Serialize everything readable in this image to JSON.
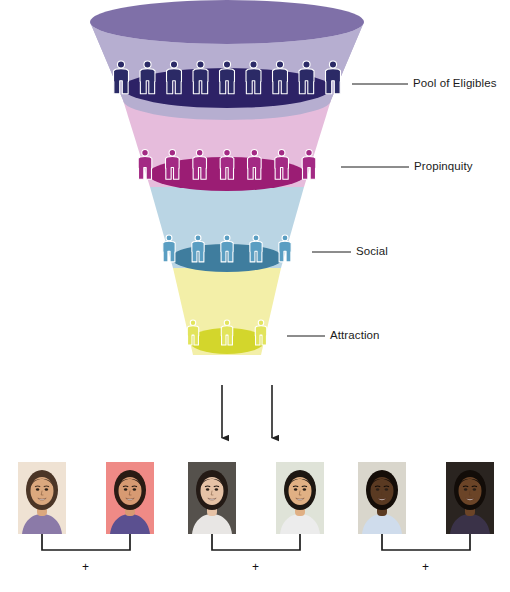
{
  "figure": {
    "background": "#ffffff"
  },
  "funnel": {
    "levels": [
      {
        "id": "pool-of-eligibles",
        "label": "Pool of Eligibles",
        "people_count": 9,
        "cone_color": "#b6aed0",
        "rim_color": "#7f70a8",
        "pool_color": "#2d2266",
        "figure_color": "#2b2a66",
        "label_x": 413,
        "label_y": 78,
        "leader_x1": 352,
        "leader_x2": 408,
        "leader_y": 84
      },
      {
        "id": "propinquity",
        "label": "Propinquity",
        "people_count": 7,
        "cone_color": "#e6bcdc",
        "rim_color": "#e6bcdc",
        "pool_color": "#9b1d74",
        "figure_color": "#a32a84",
        "label_x": 414,
        "label_y": 161,
        "leader_x1": 341,
        "leader_x2": 409,
        "leader_y": 167
      },
      {
        "id": "social",
        "label": "Social",
        "people_count": 5,
        "cone_color": "#bad5e4",
        "rim_color": "#bad5e4",
        "pool_color": "#3f7d9e",
        "figure_color": "#5a9ec2",
        "label_x": 356,
        "label_y": 246,
        "leader_x1": 312,
        "leader_x2": 351,
        "leader_y": 252
      },
      {
        "id": "attraction",
        "label": "Attraction",
        "people_count": 3,
        "cone_color": "#f3efa8",
        "rim_color": "#f3efa8",
        "pool_color": "#d3d62c",
        "figure_color": "#e2e45c",
        "label_x": 330,
        "label_y": 330,
        "leader_x1": 287,
        "leader_x2": 325,
        "leader_y": 336
      }
    ]
  },
  "arrows": {
    "count": 2,
    "color": "#222222",
    "items": [
      {
        "x": 222,
        "y_top": 385,
        "y_bottom": 445
      },
      {
        "x": 272,
        "y_top": 385,
        "y_bottom": 445
      }
    ]
  },
  "couples": [
    {
      "id": "couple-1",
      "plus": "+",
      "plus_x": 82,
      "plus_y": 561,
      "bracket": {
        "x1": 42,
        "x2": 130,
        "y_top": 534,
        "y_bottom": 550
      },
      "photos": [
        {
          "id": "person-1",
          "x": 18,
          "y": 462,
          "alt": "smiling woman with long brown hair, patterned top",
          "bg": "#efe2d3",
          "skin": "#dba87e",
          "hair": "#4b3526",
          "cloth": "#8b7aa8"
        },
        {
          "id": "person-2",
          "x": 106,
          "y": 462,
          "alt": "smiling woman with dark hair on pink background",
          "bg": "#ef8a86",
          "skin": "#d79a72",
          "hair": "#2a1b14",
          "cloth": "#5b5090"
        }
      ]
    },
    {
      "id": "couple-2",
      "plus": "+",
      "plus_x": 252,
      "plus_y": 561,
      "bracket": {
        "x1": 212,
        "x2": 300,
        "y_top": 534,
        "y_bottom": 550
      },
      "photos": [
        {
          "id": "person-3",
          "x": 188,
          "y": 462,
          "alt": "smiling woman with dark hair, light blouse",
          "bg": "#55514c",
          "skin": "#e6c2a6",
          "hair": "#241a15",
          "cloth": "#e8e6e4"
        },
        {
          "id": "person-4",
          "x": 276,
          "y": 462,
          "alt": "smiling man with short dark hair and moustache",
          "bg": "#dfe3d8",
          "skin": "#e0b084",
          "hair": "#1d1712",
          "cloth": "#ececec"
        }
      ]
    },
    {
      "id": "couple-3",
      "plus": "+",
      "plus_x": 422,
      "plus_y": 561,
      "bracket": {
        "x1": 382,
        "x2": 470,
        "y_top": 534,
        "y_bottom": 550
      },
      "photos": [
        {
          "id": "person-5",
          "x": 358,
          "y": 462,
          "alt": "smiling man in light blue shirt",
          "bg": "#d9d6cc",
          "skin": "#5a3a22",
          "hair": "#140d08",
          "cloth": "#cfdcec"
        },
        {
          "id": "person-6",
          "x": 446,
          "y": 462,
          "alt": "smiling man with beard in dark shirt",
          "bg": "#2a2420",
          "skin": "#6b4427",
          "hair": "#120c08",
          "cloth": "#3a3248"
        }
      ]
    }
  ]
}
